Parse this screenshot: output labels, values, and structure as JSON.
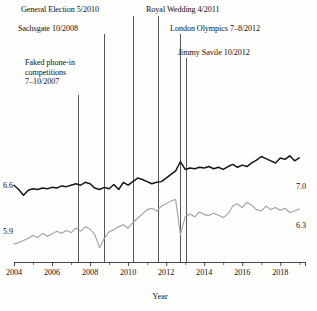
{
  "chart_data": {
    "type": "line",
    "title": "",
    "xlabel": "Year",
    "ylabel": "",
    "xlim": [
      2004.0,
      2019.3
    ],
    "ylim": [
      5.55,
      7.25
    ],
    "grid": false,
    "legend_position": "none",
    "x_ticks_major": [
      2004,
      2006,
      2008,
      2010,
      2012,
      2014,
      2016,
      2018
    ],
    "x_ticks_minor": [
      2005,
      2007,
      2009,
      2011,
      2013,
      2015,
      2017,
      2019
    ],
    "y_value_labels": [
      {
        "text": "6.6",
        "value": 6.6,
        "side": "left",
        "series": "black"
      },
      {
        "text": "5.9",
        "value": 5.9,
        "side": "left",
        "series": "gray"
      },
      {
        "text": "7.0",
        "value": 7.0,
        "side": "right",
        "series": "black"
      },
      {
        "text": "6.3",
        "value": 6.3,
        "side": "right",
        "series": "gray"
      }
    ],
    "colors": {
      "black_series": "#161616",
      "gray_series": "#a0a0a0",
      "axis": "#333333",
      "annotation_line": "#444444"
    },
    "series": [
      {
        "name": "black",
        "color": "#161616",
        "x": [
          2004.0,
          2004.25,
          2004.5,
          2004.75,
          2005.0,
          2005.25,
          2005.5,
          2005.75,
          2006.0,
          2006.25,
          2006.5,
          2006.75,
          2007.0,
          2007.25,
          2007.5,
          2007.75,
          2008.0,
          2008.25,
          2008.5,
          2008.75,
          2009.0,
          2009.25,
          2009.5,
          2009.75,
          2010.0,
          2010.25,
          2010.5,
          2010.75,
          2011.0,
          2011.25,
          2011.5,
          2011.75,
          2012.0,
          2012.25,
          2012.5,
          2012.75,
          2013.0,
          2013.25,
          2013.5,
          2013.75,
          2014.0,
          2014.25,
          2014.5,
          2014.75,
          2015.0,
          2015.25,
          2015.5,
          2015.75,
          2016.0,
          2016.25,
          2016.5,
          2016.75,
          2017.0,
          2017.25,
          2017.5,
          2017.75,
          2018.0,
          2018.25,
          2018.5,
          2018.75,
          2019.0
        ],
        "y": [
          6.62,
          6.56,
          6.48,
          6.55,
          6.57,
          6.56,
          6.58,
          6.57,
          6.59,
          6.58,
          6.61,
          6.6,
          6.62,
          6.64,
          6.62,
          6.66,
          6.64,
          6.58,
          6.56,
          6.59,
          6.57,
          6.63,
          6.56,
          6.66,
          6.62,
          6.67,
          6.72,
          6.7,
          6.67,
          6.64,
          6.66,
          6.67,
          6.72,
          6.77,
          6.82,
          6.95,
          6.84,
          6.86,
          6.85,
          6.87,
          6.86,
          6.88,
          6.85,
          6.87,
          6.84,
          6.88,
          6.91,
          6.87,
          6.9,
          6.88,
          6.93,
          6.97,
          7.02,
          6.99,
          6.96,
          6.93,
          7.0,
          6.98,
          7.03,
          6.96,
          7.0
        ]
      },
      {
        "name": "gray",
        "color": "#a0a0a0",
        "x": [
          2004.0,
          2004.25,
          2004.5,
          2004.75,
          2005.0,
          2005.25,
          2005.5,
          2005.75,
          2006.0,
          2006.25,
          2006.5,
          2006.75,
          2007.0,
          2007.25,
          2007.5,
          2007.75,
          2008.0,
          2008.25,
          2008.5,
          2008.75,
          2009.0,
          2009.25,
          2009.5,
          2009.75,
          2010.0,
          2010.25,
          2010.5,
          2010.75,
          2011.0,
          2011.25,
          2011.5,
          2011.75,
          2012.0,
          2012.25,
          2012.5,
          2012.75,
          2013.0,
          2013.25,
          2013.5,
          2013.75,
          2014.0,
          2014.25,
          2014.5,
          2014.75,
          2015.0,
          2015.25,
          2015.5,
          2015.75,
          2016.0,
          2016.25,
          2016.5,
          2016.75,
          2017.0,
          2017.25,
          2017.5,
          2017.75,
          2018.0,
          2018.25,
          2018.5,
          2018.75,
          2019.0
        ],
        "y": [
          5.8,
          5.82,
          5.85,
          5.88,
          5.92,
          5.89,
          5.95,
          5.91,
          5.94,
          5.98,
          5.95,
          5.99,
          5.96,
          6.02,
          5.98,
          6.04,
          6.01,
          5.93,
          5.75,
          5.88,
          5.97,
          6.0,
          6.04,
          6.07,
          6.02,
          6.1,
          6.16,
          6.22,
          6.28,
          6.3,
          6.26,
          6.33,
          6.36,
          6.4,
          6.42,
          5.93,
          6.18,
          6.22,
          6.18,
          6.25,
          6.21,
          6.2,
          6.23,
          6.2,
          6.17,
          6.22,
          6.33,
          6.36,
          6.31,
          6.38,
          6.34,
          6.28,
          6.26,
          6.33,
          6.28,
          6.31,
          6.27,
          6.3,
          6.24,
          6.26,
          6.29
        ]
      }
    ],
    "annotations": [
      {
        "id": "faked-phone-in",
        "label": "Faked phone-in competitions 7–10/2007",
        "label_lines": [
          "Faked phone-in",
          "competitions",
          "7–10/2007"
        ],
        "x_value": 2007.7,
        "px_x": 78,
        "label_left": 25,
        "label_top": 58,
        "line_top": 95,
        "multiline": true
      },
      {
        "id": "sachsgate",
        "label": "Sachsgate 10/2008",
        "label_lines": [
          "Sachsgate 10/2008"
        ],
        "x_value": 2008.8,
        "px_x": 104,
        "label_left": 18,
        "label_top": 24,
        "line_top": 34,
        "multiline": false
      },
      {
        "id": "general-election",
        "label": "General Election 5/2010",
        "label_lines": [
          "General Election 5/2010"
        ],
        "x_value": 2010.4,
        "px_x": 133,
        "label_left": 21,
        "label_top": 5,
        "line_top": 16,
        "multiline": false
      },
      {
        "id": "royal-wedding",
        "label": "Royal Wedding 4/2011",
        "label_lines": [
          "Royal Wedding 4/2011"
        ],
        "x_value": 2011.3,
        "px_x": 158,
        "label_left": 146,
        "label_top": 5,
        "line_top": 16,
        "multiline": false
      },
      {
        "id": "london-olympics",
        "label": "London Olympics 7–8/2012",
        "label_lines": [
          "London Olympics 7–8/2012"
        ],
        "x_value": 2012.6,
        "px_x": 180,
        "label_left": 170,
        "label_top": 24,
        "line_top": 34,
        "multiline": false
      },
      {
        "id": "jimmy-savile",
        "label": "Jimmy Savile 10/2012",
        "label_lines": [
          "Jimmy Savile 10/2012"
        ],
        "x_value": 2012.85,
        "px_x": 186,
        "label_left": 178,
        "label_top": 48,
        "line_top": 58,
        "multiline": false
      }
    ]
  },
  "axis": {
    "x_title": "Year",
    "x_tick_labels": [
      "2004",
      "2006",
      "2008",
      "2010",
      "2012",
      "2014",
      "2016",
      "2018"
    ],
    "left_labels": [
      "6.6",
      "5.9"
    ],
    "right_labels": [
      "7.0",
      "6.3"
    ]
  }
}
